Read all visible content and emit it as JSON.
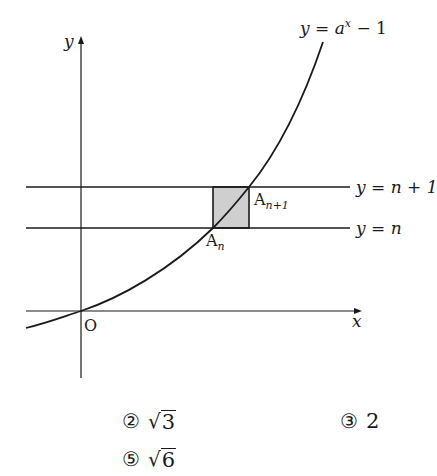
{
  "diagram": {
    "curve_label": "y = a^x − 1",
    "curve_label_parts": {
      "prefix": "y = a",
      "sup": "x",
      "suffix": " − 1"
    },
    "y_axis_label": "y",
    "x_axis_label": "x",
    "origin_label": "O",
    "line_top_label": "y = n + 1",
    "line_bottom_label": "y = n",
    "point_lower": {
      "base": "A",
      "sub": "n"
    },
    "point_upper": {
      "base": "A",
      "sub": "n+1"
    },
    "colors": {
      "stroke": "#1a1a1a",
      "shade": "#cfcfcf"
    }
  },
  "choices": [
    {
      "marker": "②",
      "value": "3",
      "sqrt": true
    },
    {
      "marker": "③",
      "value": "2",
      "sqrt": false
    },
    {
      "marker": "⑤",
      "value": "6",
      "sqrt": true
    }
  ]
}
